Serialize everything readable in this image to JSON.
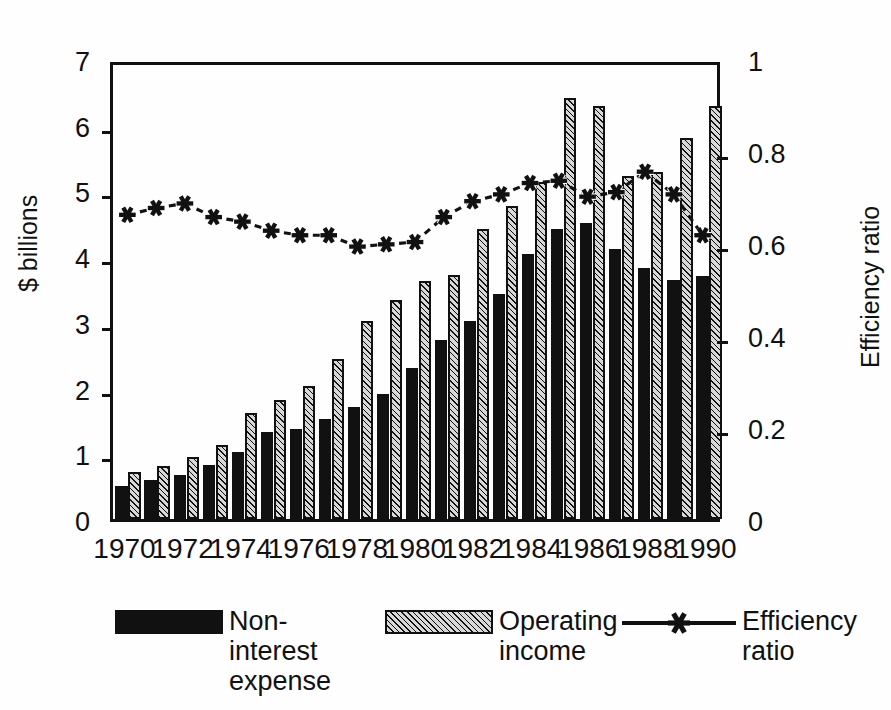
{
  "chart_data": {
    "type": "bar",
    "title": "",
    "subtitle": "",
    "xlabel": "",
    "ylabel": "$ billions",
    "y2label": "Efficiency ratio",
    "ylim": [
      0,
      7
    ],
    "y2lim": [
      0,
      1
    ],
    "grid": false,
    "legend_position": "bottom",
    "x": [
      1970,
      1971,
      1972,
      1973,
      1974,
      1975,
      1976,
      1977,
      1978,
      1979,
      1980,
      1981,
      1982,
      1983,
      1984,
      1985,
      1986,
      1987,
      1988,
      1989,
      1990
    ],
    "categories": [
      "1970",
      "1971",
      "1972",
      "1973",
      "1974",
      "1975",
      "1976",
      "1977",
      "1978",
      "1979",
      "1980",
      "1981",
      "1982",
      "1983",
      "1984",
      "1985",
      "1986",
      "1987",
      "1988",
      "1989",
      "1990"
    ],
    "xtick_labels": [
      "1970",
      "1972",
      "1974",
      "1976",
      "1978",
      "1980",
      "1982",
      "1984",
      "1986",
      "1988",
      "1990"
    ],
    "ytick_labels": [
      "0",
      "1",
      "2",
      "3",
      "4",
      "5",
      "6",
      "7"
    ],
    "y2tick_labels": [
      "0",
      "0.2",
      "0.4",
      "0.6",
      "0.8",
      "1"
    ],
    "series": [
      {
        "name": "Non-interest expense",
        "type": "bar",
        "axis": "left",
        "color": "#111111",
        "fill": "solid",
        "values": [
          0.5,
          0.6,
          0.67,
          0.82,
          1.02,
          1.32,
          1.37,
          1.52,
          1.7,
          1.9,
          2.3,
          2.72,
          3.02,
          3.42,
          4.03,
          4.42,
          4.5,
          4.11,
          3.82,
          3.63,
          3.7
        ]
      },
      {
        "name": "Operating income",
        "type": "bar",
        "axis": "left",
        "color": "#d8d8d8",
        "fill": "hatched",
        "values": [
          0.72,
          0.8,
          0.95,
          1.12,
          1.61,
          1.81,
          2.03,
          2.43,
          3.01,
          3.33,
          3.62,
          3.71,
          4.41,
          4.76,
          5.13,
          6.41,
          6.28,
          5.22,
          5.28,
          5.8,
          6.28
        ]
      },
      {
        "name": "Efficiency ratio",
        "type": "line",
        "axis": "right",
        "color": "#111111",
        "marker": "asterisk",
        "linestyle": "dashed",
        "values": [
          0.67,
          0.685,
          0.695,
          0.665,
          0.655,
          0.635,
          0.625,
          0.625,
          0.6,
          0.605,
          0.61,
          0.665,
          0.7,
          0.715,
          0.74,
          0.745,
          0.71,
          0.72,
          0.765,
          0.715,
          0.625
        ]
      }
    ],
    "annotations": []
  },
  "axes": {
    "left_title": "$ billions",
    "right_title": "Efficiency ratio"
  },
  "legend": {
    "items": [
      {
        "label": "Non-\ninterest\nexpense",
        "swatch": "solid-black-swatch"
      },
      {
        "label": "Operating\nincome",
        "swatch": "hatched-gray-swatch"
      },
      {
        "label": "Efficiency\nratio",
        "swatch": "dashed-line-asterisk-marker"
      }
    ]
  },
  "colors": {
    "ink": "#111111",
    "expense_fill": "#111111",
    "income_fill": "#d8d8d8",
    "background": "#fefefe"
  }
}
